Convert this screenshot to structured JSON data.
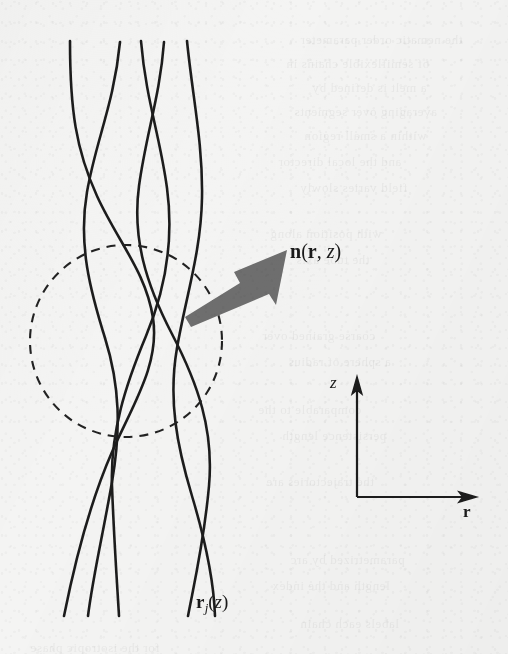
{
  "figure": {
    "kind": "scientific-diagram-scan",
    "background_color": "#f4f4f3",
    "ink_color": "#1a1a1a",
    "arrow_color": "#6e6e6e"
  },
  "labels": {
    "director": {
      "full": "n(r, z)",
      "symbol_n": "n",
      "paren_open": "(",
      "symbol_r": "r",
      "comma": ", ",
      "symbol_z": "z",
      "paren_close": ")"
    },
    "chain": {
      "full": "rj(z)",
      "symbol_r": "r",
      "subscript_j": "j",
      "paren_open": "(",
      "symbol_z": "z",
      "paren_close": ")"
    },
    "axis_z": "z",
    "axis_r": "r"
  },
  "axes": {
    "origin": [
      357,
      497
    ],
    "z_axis": {
      "label": "z",
      "tip": [
        357,
        375
      ],
      "direction": "up"
    },
    "r_axis": {
      "label": "r",
      "tip": [
        479,
        497
      ],
      "direction": "right"
    }
  },
  "director_arrow": {
    "tail": [
      185,
      313
    ],
    "tip": [
      287,
      250
    ],
    "color": "#6e6e6e",
    "shaft_width": 11
  },
  "coarse_grain_circle": {
    "center": [
      126,
      341
    ],
    "radius": 96,
    "style": "dashed",
    "dash": "9 7",
    "stroke_width": 2.1
  },
  "chains": {
    "count": 5,
    "stroke_width": 2.6,
    "color": "#1f1f1f",
    "top_y": 41,
    "bottom_y": 616,
    "paths": [
      "M 70,41 C 70,110 76,150 97,196 C 118,242 146,272 153,318 C 160,364 133,404 112,452 C 91,500 76,556 64,616",
      "M 120,42 C 114,104 96,140 87,192 C 78,244 90,290 105,338 C 120,386 121,430 112,482 C 103,534 93,576 88,616",
      "M 141,41 C 146,100 160,136 167,188 C 174,240 166,288 146,336 C 126,384 110,432 112,486 C 114,540 117,582 119,616",
      "M 164,42 C 160,96 146,134 139,186 C 132,238 146,284 172,334 C 198,384 214,430 209,486 C 204,542 194,584 188,616",
      "M 187,41 C 193,100 203,144 202,198 C 201,252 186,296 177,348 C 168,400 177,446 192,496 C 207,546 214,586 215,616"
    ]
  }
}
